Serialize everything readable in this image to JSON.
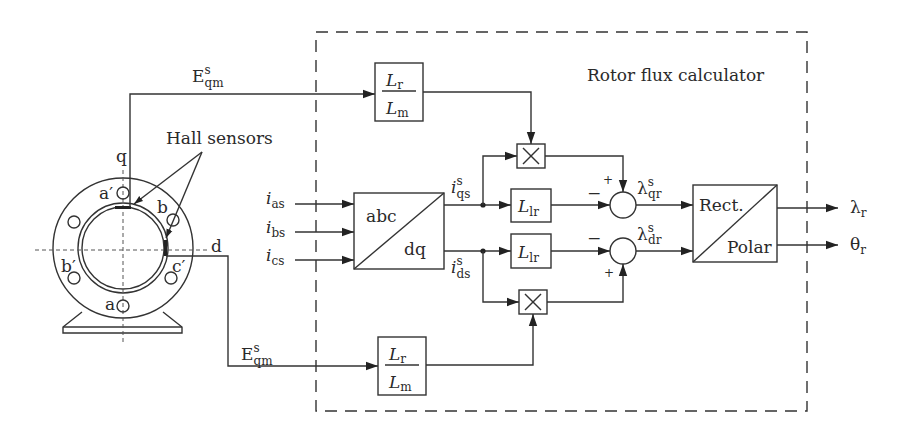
{
  "diagram": {
    "title": "Rotor flux calculator",
    "motor": {
      "axis_q": "q",
      "axis_d": "d",
      "windings": [
        "a′",
        "b",
        "b′",
        "c′",
        "a"
      ],
      "hall_label": "Hall sensors"
    },
    "signals": {
      "eqm_top": {
        "base": "E",
        "sup": "s",
        "sub": "qm"
      },
      "eqm_bottom": {
        "base": "E",
        "sup": "s",
        "sub": "qm"
      },
      "i_as": {
        "base": "i",
        "sub": "as"
      },
      "i_bs": {
        "base": "i",
        "sub": "bs"
      },
      "i_cs": {
        "base": "i",
        "sub": "cs"
      },
      "i_qs": {
        "base": "i",
        "sup": "s",
        "sub": "qs"
      },
      "i_ds": {
        "base": "i",
        "sup": "s",
        "sub": "ds"
      },
      "lambda_qr": {
        "base": "λ",
        "sup": "s",
        "sub": "qr"
      },
      "lambda_dr": {
        "base": "λ",
        "sup": "s",
        "sub": "dr"
      },
      "lambda_r": {
        "base": "λ",
        "sub": "r"
      },
      "theta_r": {
        "base": "θ",
        "sub": "r"
      }
    },
    "blocks": {
      "gain_top": {
        "num": "L",
        "num_sub": "r",
        "den": "L",
        "den_sub": "m"
      },
      "gain_bottom": {
        "num": "L",
        "num_sub": "r",
        "den": "L",
        "den_sub": "m"
      },
      "transform": {
        "top": "abc",
        "bottom": "dq"
      },
      "llr_top": {
        "base": "L",
        "sub": "lr"
      },
      "llr_bottom": {
        "base": "L",
        "sub": "lr"
      },
      "mult_symbol": "×",
      "rect_polar": {
        "top": "Rect.",
        "bottom": "Polar"
      }
    },
    "summer_signs": {
      "top_plus": "+",
      "top_minus": "−",
      "bottom_plus": "+",
      "bottom_minus": "−"
    }
  }
}
